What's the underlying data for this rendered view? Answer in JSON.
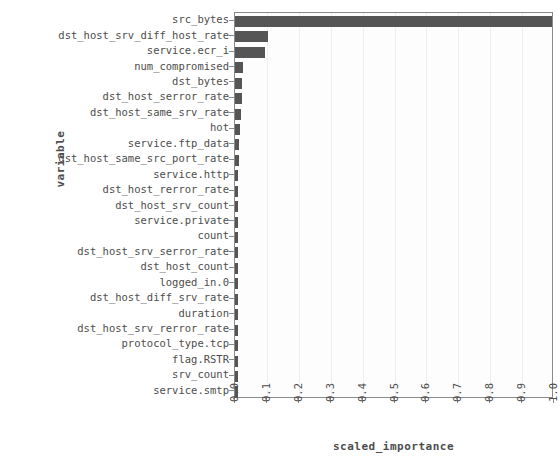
{
  "chart_data": {
    "type": "bar",
    "orientation": "horizontal",
    "title": "",
    "xlabel": "scaled_importance",
    "ylabel": "variable",
    "xlim": [
      0.0,
      1.0
    ],
    "grid": true,
    "legend": null,
    "bar_color": "#555555",
    "panel_background": "#fdfdfd",
    "text_color": "#4d4d4d",
    "xticks": [
      "0.0",
      "0.1",
      "0.2",
      "0.3",
      "0.4",
      "0.5",
      "0.6",
      "0.7",
      "0.8",
      "0.9",
      "1.0"
    ],
    "xtick_values": [
      0.0,
      0.1,
      0.2,
      0.3,
      0.4,
      0.5,
      0.6,
      0.7,
      0.8,
      0.9,
      1.0
    ],
    "categories": [
      "src_bytes",
      "dst_host_srv_diff_host_rate",
      "service.ecr_i",
      "num_compromised",
      "dst_bytes",
      "dst_host_serror_rate",
      "dst_host_same_srv_rate",
      "hot",
      "service.ftp_data",
      "dst_host_same_src_port_rate",
      "service.http",
      "dst_host_rerror_rate",
      "dst_host_srv_count",
      "service.private",
      "count",
      "dst_host_srv_serror_rate",
      "dst_host_count",
      "logged_in.0",
      "dst_host_diff_srv_rate",
      "duration",
      "dst_host_srv_rerror_rate",
      "protocol_type.tcp",
      "flag.RSTR",
      "srv_count",
      "service.smtp"
    ],
    "values": [
      1.0,
      0.105,
      0.095,
      0.024,
      0.023,
      0.022,
      0.02,
      0.016,
      0.014,
      0.013,
      0.01,
      0.009,
      0.008,
      0.008,
      0.007,
      0.006,
      0.006,
      0.005,
      0.005,
      0.004,
      0.004,
      0.003,
      0.003,
      0.002,
      0.002
    ]
  }
}
